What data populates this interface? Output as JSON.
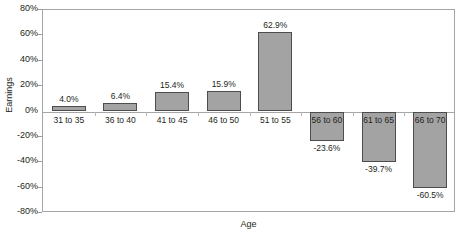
{
  "chart_data": {
    "type": "bar",
    "title": "",
    "xlabel": "Age",
    "ylabel": "Earnings",
    "categories": [
      "31 to 35",
      "36 to 40",
      "41 to 45",
      "46 to 50",
      "51 to 55",
      "56 to 60",
      "61 to 65",
      "66 to 70"
    ],
    "values": [
      4.0,
      6.4,
      15.4,
      15.9,
      62.9,
      -23.6,
      -39.7,
      -60.5
    ],
    "value_labels": [
      "4.0%",
      "6.4%",
      "15.4%",
      "15.9%",
      "62.9%",
      "-23.6%",
      "-39.7%",
      "-60.5%"
    ],
    "ylim": [
      -80,
      80
    ],
    "ytick_values": [
      80,
      60,
      40,
      20,
      0,
      -20,
      -40,
      -60,
      -80
    ],
    "ytick_labels": [
      "80%",
      "60%",
      "40%",
      "20%",
      "0%",
      "-20%",
      "-40%",
      "-60%",
      "-80%"
    ],
    "grid": false,
    "legend": "none",
    "bar_fill_color": "#a3a3a3",
    "bar_border_color": "#4d4d4d",
    "axis_color": "#a6a6a6"
  }
}
